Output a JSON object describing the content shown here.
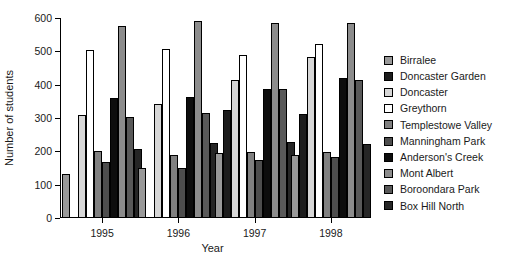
{
  "chart_data": {
    "type": "bar",
    "title": "",
    "subtitle": "",
    "xlabel": "Year",
    "ylabel": "Number of students",
    "categories": [
      "1995",
      "1996",
      "1997",
      "1998"
    ],
    "ylim": [
      0,
      600
    ],
    "yticks": [
      0,
      100,
      200,
      300,
      400,
      500,
      600
    ],
    "ytick_labels": [
      "0",
      "100",
      "200",
      "300",
      "400",
      "500",
      "600"
    ],
    "grid": false,
    "legend_position": "right",
    "series": [
      {
        "name": "Birralee",
        "color": "#999999",
        "values": [
          133,
          151,
          196,
          190
        ]
      },
      {
        "name": "Doncaster Garden",
        "color": "#1c1c1c",
        "values": [
          0,
          0,
          323,
          313
        ]
      },
      {
        "name": "Doncaster",
        "color": "#d6d6d6",
        "values": [
          309,
          343,
          413,
          483
        ]
      },
      {
        "name": "Greythorn",
        "color": "#ffffff",
        "values": [
          503,
          507,
          490,
          523
        ]
      },
      {
        "name": "Templestowe Valley",
        "color": "#808080",
        "values": [
          202,
          189,
          197,
          197
        ]
      },
      {
        "name": "Manningham Park",
        "color": "#4d4d4d",
        "values": [
          168,
          149,
          174,
          182
        ]
      },
      {
        "name": "Anderson's Creek",
        "color": "#0d0d0d",
        "values": [
          360,
          363,
          387,
          421
        ]
      },
      {
        "name": "Mont Albert",
        "color": "#8c8c8c",
        "values": [
          575,
          591,
          586,
          584
        ]
      },
      {
        "name": "Boroondara Park",
        "color": "#595959",
        "values": [
          303,
          315,
          388,
          415
        ]
      },
      {
        "name": "Box Hill North",
        "color": "#262626",
        "values": [
          208,
          224,
          229,
          223
        ]
      }
    ]
  },
  "legend": {
    "items": [
      {
        "label": "Birralee"
      },
      {
        "label": "Doncaster Garden"
      },
      {
        "label": "Doncaster"
      },
      {
        "label": "Greythorn"
      },
      {
        "label": "Templestowe Valley"
      },
      {
        "label": "Manningham Park"
      },
      {
        "label": "Anderson's Creek"
      },
      {
        "label": "Mont Albert"
      },
      {
        "label": "Boroondara Park"
      },
      {
        "label": "Box Hill North"
      }
    ]
  }
}
